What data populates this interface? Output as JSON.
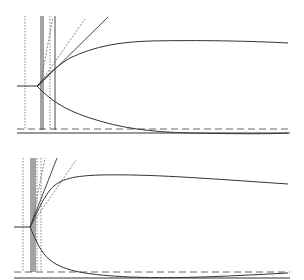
{
  "figure": {
    "width": 304,
    "height": 280,
    "background": "#ffffff",
    "stroke_color": "#333333",
    "light_stroke": "#666666",
    "panels": [
      {
        "name": "top-panel",
        "stub": {
          "x1": 17,
          "x2": 37,
          "y": 86
        },
        "branch_point": {
          "x": 37,
          "y": 86
        },
        "upper_curve": "M37,86 C50,72 60,64 70,58 C95,46 120,42 150,41 C200,40 250,41 288,43",
        "lower_curve": "M37,86 C50,100 65,110 90,118 C120,128 150,132 190,133 C240,134 270,134 288,133",
        "solid_verticals": [
          41,
          43,
          55
        ],
        "dotted_verticals": [
          25,
          50
        ],
        "vertical_top": 16,
        "vertical_bottom": 130,
        "tangent_solid": [
          {
            "x1": 38,
            "y1": 86,
            "x2": 108,
            "y2": 17
          }
        ],
        "tangent_dotted": [
          {
            "x1": 38,
            "y1": 86,
            "x2": 85,
            "y2": 19
          },
          {
            "x1": 40,
            "y1": 86,
            "x2": 53,
            "y2": 17
          }
        ],
        "dashed_y": 129,
        "baseline_y": 133,
        "baseline_x1": 17,
        "baseline_x2": 290
      },
      {
        "name": "bottom-panel",
        "stub": {
          "x1": 14,
          "x2": 30,
          "y": 227
        },
        "branch_point": {
          "x": 30,
          "y": 227
        },
        "upper_curve": "M30,227 C36,215 42,200 50,190 C60,178 75,176 100,175 C150,174 200,178 288,184",
        "lower_curve": "M30,227 C36,240 40,252 50,260 C65,272 90,275 130,277 C180,279 230,276 288,273",
        "solid_verticals": [
          31,
          33,
          35
        ],
        "dotted_verticals": [
          23,
          37,
          41
        ],
        "vertical_top": 158,
        "vertical_bottom": 272,
        "tangent_solid": [
          {
            "x1": 30,
            "y1": 227,
            "x2": 57,
            "y2": 158
          }
        ],
        "tangent_dotted": [
          {
            "x1": 30,
            "y1": 227,
            "x2": 76,
            "y2": 160
          },
          {
            "x1": 31,
            "y1": 227,
            "x2": 45,
            "y2": 158
          }
        ],
        "dashed_y": 272,
        "baseline_y": 278,
        "baseline_x1": 14,
        "baseline_x2": 290
      }
    ]
  }
}
